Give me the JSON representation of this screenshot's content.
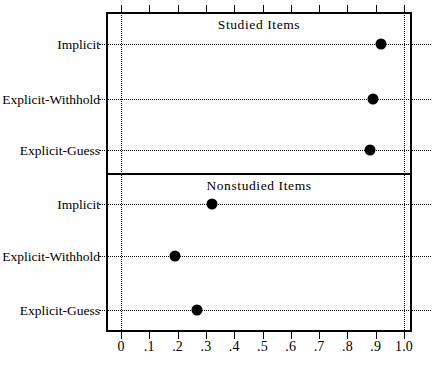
{
  "chart_data": {
    "type": "scatter",
    "title": "",
    "xlabel": "",
    "ylabel": "",
    "xlim": [
      0,
      1.0
    ],
    "grid": true,
    "legend": false,
    "x_ticks": [
      0,
      0.1,
      0.2,
      0.3,
      0.4,
      0.5,
      0.6,
      0.7,
      0.8,
      0.9,
      1.0
    ],
    "x_tick_labels": [
      "0",
      ".1",
      ".2",
      ".3",
      ".4",
      ".5",
      ".6",
      ".7",
      ".8",
      ".9",
      "1.0"
    ],
    "categories": [
      "Implicit",
      "Explicit-Withhold",
      "Explicit-Guess"
    ],
    "panels": [
      {
        "title": "Studied Items",
        "points": [
          {
            "category": "Implicit",
            "value": 0.92
          },
          {
            "category": "Explicit-Withhold",
            "value": 0.89
          },
          {
            "category": "Explicit-Guess",
            "value": 0.88
          }
        ]
      },
      {
        "title": "Nonstudied Items",
        "points": [
          {
            "category": "Implicit",
            "value": 0.32
          },
          {
            "category": "Explicit-Withhold",
            "value": 0.19
          },
          {
            "category": "Explicit-Guess",
            "value": 0.27
          }
        ]
      }
    ],
    "colors": {
      "marker": "#000000",
      "axis": "#000000",
      "grid": "#000000",
      "background": "#ffffff"
    }
  }
}
